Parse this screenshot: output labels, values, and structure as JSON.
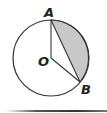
{
  "figure": {
    "type": "circle-sector-segment",
    "center_label": "O",
    "points": [
      {
        "label": "A",
        "position": "top"
      },
      {
        "label": "B",
        "position": "lower-right"
      }
    ],
    "shaded_region": "segment between chord AB and minor arc AB",
    "colors": {
      "stroke": "#333333",
      "shade": "#c8c8c8",
      "background": "#ffffff"
    }
  }
}
